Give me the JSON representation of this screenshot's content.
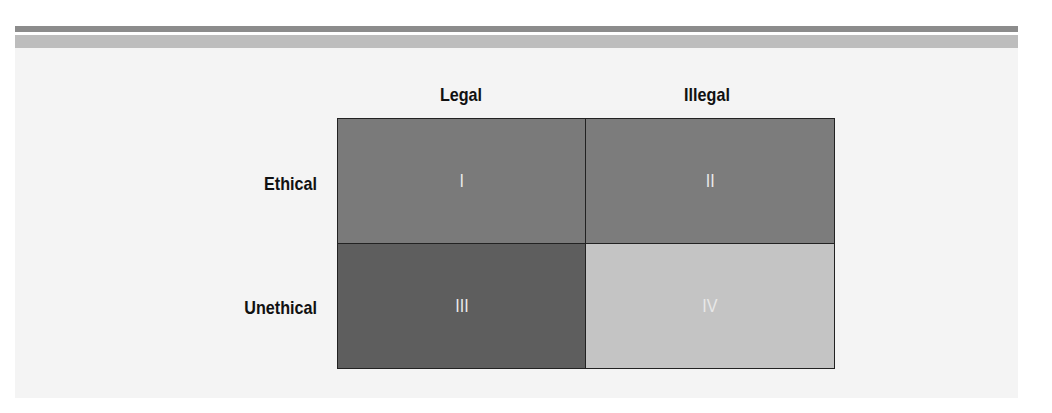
{
  "diagram": {
    "columns": [
      {
        "label": "Legal"
      },
      {
        "label": "Illegal"
      }
    ],
    "rows": [
      {
        "label": "Ethical"
      },
      {
        "label": "Unethical"
      }
    ],
    "cells": [
      {
        "label": "I",
        "row": "Ethical",
        "column": "Legal",
        "color": "#7a7a7a"
      },
      {
        "label": "II",
        "row": "Ethical",
        "column": "Illegal",
        "color": "#7c7c7c"
      },
      {
        "label": "III",
        "row": "Unethical",
        "column": "Legal",
        "color": "#5e5e5e"
      },
      {
        "label": "IV",
        "row": "Unethical",
        "column": "Illegal",
        "color": "#c4c4c4"
      }
    ]
  }
}
